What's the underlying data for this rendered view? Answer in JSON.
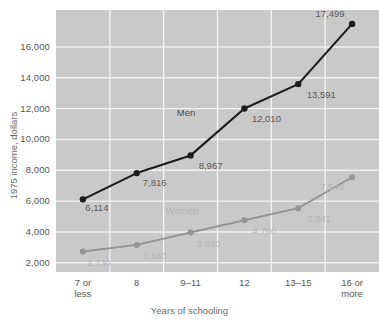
{
  "chart_data": {
    "type": "line",
    "title": "",
    "xlabel": "Years of schooling",
    "ylabel": "1975 income, dollars",
    "categories": [
      "7 or\nless",
      "8",
      "9–11",
      "12",
      "13–15",
      "16 or\nmore"
    ],
    "ylim": [
      1400,
      18400
    ],
    "yticks": [
      2000,
      4000,
      6000,
      8000,
      10000,
      12000,
      14000,
      16000
    ],
    "ytick_labels": [
      "2,000",
      "4,000",
      "6,000",
      "8,000",
      "10,000",
      "12,000",
      "14,000",
      "16,000"
    ],
    "grid": true,
    "legend": "inline-annotation",
    "plot_background": "#c9c9c9",
    "gridline_color": "#f2f2f2",
    "series": [
      {
        "name": "Men",
        "color": "#1c1c1c",
        "values": [
          6114,
          7816,
          8967,
          12010,
          13591,
          17499
        ],
        "value_labels": [
          "6,114",
          "7,816",
          "8,967",
          "12,010",
          "13,591",
          "17,499"
        ]
      },
      {
        "name": "Women",
        "color": "#949494",
        "values": [
          2730,
          3160,
          3960,
          4760,
          5541,
          7546
        ],
        "value_labels": [
          "2,730",
          "3,160",
          "3,960",
          "4,760",
          "5,541",
          "7,546"
        ]
      }
    ]
  }
}
